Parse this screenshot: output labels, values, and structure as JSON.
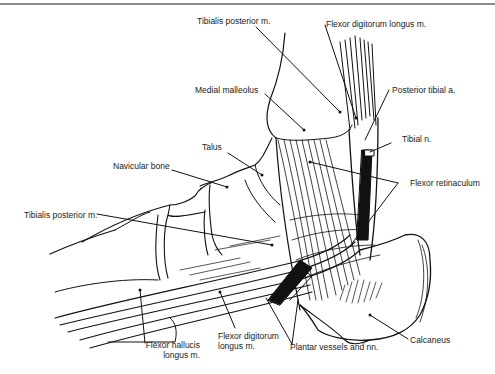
{
  "figure": {
    "labels": {
      "tibialis_posterior_top": "Tibialis posterior m.",
      "flexor_digitorum_longus_top": "Flexor digitorum longus m.",
      "medial_malleolus": "Medial malleolus",
      "posterior_tibial_artery": "Posterior tibial a.",
      "talus": "Talus",
      "tibial_nerve": "Tibial n.",
      "navicular_bone": "Navicular bone",
      "flexor_retinaculum": "Flexor retinaculum",
      "tibialis_posterior_left": "Tibialis posterior m.",
      "flexor_hallucis_longus_line1": "Flexor hallucis",
      "flexor_hallucis_longus_line2": "longus m.",
      "flexor_digitorum_longus_bottom_line1": "Flexor digitorum",
      "flexor_digitorum_longus_bottom_line2": "longus m.",
      "plantar_vessels": "Plantar vessels and nn.",
      "calcaneus": "Calcaneus"
    },
    "colors": {
      "ink": "#111111",
      "rule": "#8a8a8a",
      "background": "#ffffff"
    }
  }
}
